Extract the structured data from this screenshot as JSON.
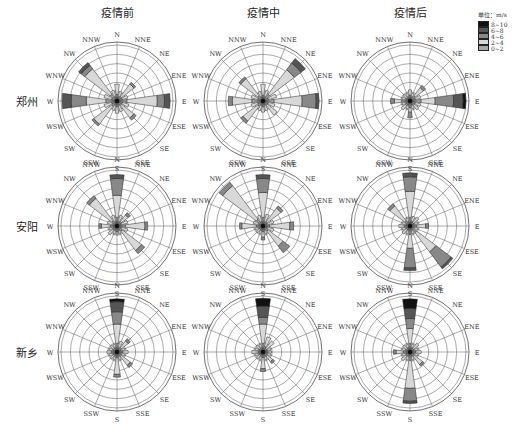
{
  "chart_data": {
    "type": "windrose",
    "columns": [
      "疫情前",
      "疫情中",
      "疫情后"
    ],
    "rows": [
      "郑州",
      "安阳",
      "新乡"
    ],
    "directions": [
      "N",
      "NNE",
      "NE",
      "ENE",
      "E",
      "ESE",
      "SE",
      "SSE",
      "S",
      "SSW",
      "SW",
      "WSW",
      "W",
      "WNW",
      "NW",
      "NNW"
    ],
    "legend": {
      "unit_label": "单位：m/s",
      "bins": [
        {
          "label": "8~10",
          "color": "#111111"
        },
        {
          "label": "6~8",
          "color": "#555555"
        },
        {
          "label": "4~6",
          "color": "#888888"
        },
        {
          "label": "2~4",
          "color": "#d8d8d8"
        },
        {
          "label": "0~2",
          "color": "#a8a8a8"
        }
      ]
    },
    "ring_count": 6,
    "note": "Each panel: per direction, cumulative radial extent (fraction of max radius) of speed bins in order [0~2, 2~4, 4~6, 6~8, 8~10]",
    "panels": [
      {
        "row": "郑州",
        "col": "疫情前",
        "stacks": {
          "N": [
            0.12,
            0.3,
            0,
            0,
            0
          ],
          "NNE": [
            0.08,
            0.18,
            0,
            0,
            0
          ],
          "NE": [
            0.1,
            0.38,
            0.42,
            0,
            0
          ],
          "ENE": [
            0.1,
            0.2,
            0,
            0,
            0
          ],
          "E": [
            0.18,
            0.72,
            0.85,
            0.95,
            0
          ],
          "ESE": [
            0.1,
            0.22,
            0,
            0,
            0
          ],
          "SE": [
            0.1,
            0.38,
            0.43,
            0,
            0
          ],
          "SSE": [
            0.08,
            0.2,
            0,
            0,
            0
          ],
          "S": [
            0.1,
            0.22,
            0,
            0,
            0
          ],
          "SSW": [
            0.08,
            0.18,
            0,
            0,
            0
          ],
          "SW": [
            0.12,
            0.52,
            0.56,
            0,
            0
          ],
          "WSW": [
            0.1,
            0.24,
            0,
            0,
            0
          ],
          "W": [
            0.2,
            0.55,
            0.82,
            0.98,
            0
          ],
          "WNW": [
            0.1,
            0.24,
            0,
            0,
            0
          ],
          "NW": [
            0.15,
            0.72,
            0.8,
            0.86,
            0
          ],
          "NNW": [
            0.08,
            0.2,
            0,
            0,
            0
          ]
        }
      },
      {
        "row": "郑州",
        "col": "疫情中",
        "stacks": {
          "N": [
            0.1,
            0.3,
            0,
            0,
            0
          ],
          "NNE": [
            0.08,
            0.2,
            0,
            0,
            0
          ],
          "NE": [
            0.15,
            0.7,
            0.85,
            0.95,
            0
          ],
          "ENE": [
            0.1,
            0.25,
            0,
            0,
            0
          ],
          "E": [
            0.2,
            0.7,
            0.95,
            1.0,
            0
          ],
          "ESE": [
            0.1,
            0.22,
            0,
            0,
            0
          ],
          "SE": [
            0.1,
            0.32,
            0,
            0,
            0
          ],
          "SSE": [
            0.08,
            0.18,
            0,
            0,
            0
          ],
          "S": [
            0.1,
            0.2,
            0,
            0,
            0
          ],
          "SSW": [
            0.08,
            0.18,
            0,
            0,
            0
          ],
          "SW": [
            0.12,
            0.45,
            0.5,
            0,
            0
          ],
          "WSW": [
            0.1,
            0.22,
            0,
            0,
            0
          ],
          "W": [
            0.2,
            0.55,
            0.62,
            0,
            0
          ],
          "WNW": [
            0.1,
            0.22,
            0,
            0,
            0
          ],
          "NW": [
            0.12,
            0.5,
            0.54,
            0,
            0
          ],
          "NNW": [
            0.08,
            0.18,
            0,
            0,
            0
          ]
        }
      },
      {
        "row": "郑州",
        "col": "疫情后",
        "stacks": {
          "N": [
            0.1,
            0.2,
            0,
            0,
            0
          ],
          "NNE": [
            0.08,
            0.15,
            0,
            0,
            0
          ],
          "NE": [
            0.12,
            0.3,
            0.35,
            0,
            0
          ],
          "ENE": [
            0.1,
            0.2,
            0,
            0,
            0
          ],
          "E": [
            0.2,
            0.45,
            0.78,
            0.95,
            1.0
          ],
          "ESE": [
            0.1,
            0.2,
            0,
            0,
            0
          ],
          "SE": [
            0.1,
            0.2,
            0,
            0,
            0
          ],
          "SSE": [
            0.08,
            0.15,
            0,
            0,
            0
          ],
          "S": [
            0.12,
            0.2,
            0.3,
            0,
            0
          ],
          "SSW": [
            0.08,
            0.15,
            0,
            0,
            0
          ],
          "SW": [
            0.1,
            0.2,
            0,
            0,
            0
          ],
          "WSW": [
            0.08,
            0.15,
            0,
            0,
            0
          ],
          "W": [
            0.15,
            0.28,
            0.35,
            0,
            0
          ],
          "WNW": [
            0.08,
            0.15,
            0,
            0,
            0
          ],
          "NW": [
            0.08,
            0.15,
            0,
            0,
            0
          ],
          "NNW": [
            0.08,
            0.15,
            0,
            0,
            0
          ]
        }
      },
      {
        "row": "安阳",
        "col": "疫情前",
        "stacks": {
          "N": [
            0.15,
            0.55,
            0.85,
            0.92,
            0
          ],
          "NNE": [
            0.08,
            0.2,
            0,
            0,
            0
          ],
          "NE": [
            0.1,
            0.25,
            0.3,
            0,
            0
          ],
          "ENE": [
            0.08,
            0.2,
            0,
            0,
            0
          ],
          "E": [
            0.15,
            0.5,
            0.55,
            0,
            0
          ],
          "ESE": [
            0.08,
            0.2,
            0,
            0,
            0
          ],
          "SE": [
            0.12,
            0.55,
            0.62,
            0,
            0
          ],
          "SSE": [
            0.08,
            0.15,
            0,
            0,
            0
          ],
          "S": [
            0.1,
            0.15,
            0,
            0,
            0
          ],
          "SSW": [
            0.08,
            0.15,
            0,
            0,
            0
          ],
          "SW": [
            0.1,
            0.2,
            0,
            0,
            0
          ],
          "WSW": [
            0.08,
            0.15,
            0,
            0,
            0
          ],
          "W": [
            0.12,
            0.28,
            0.32,
            0,
            0
          ],
          "WNW": [
            0.08,
            0.18,
            0,
            0,
            0
          ],
          "NW": [
            0.12,
            0.62,
            0.68,
            0,
            0
          ],
          "NNW": [
            0.08,
            0.2,
            0,
            0,
            0
          ]
        }
      },
      {
        "row": "安阳",
        "col": "疫情中",
        "stacks": {
          "N": [
            0.15,
            0.6,
            0.85,
            0.92,
            0
          ],
          "NNE": [
            0.08,
            0.22,
            0,
            0,
            0
          ],
          "NE": [
            0.1,
            0.4,
            0.45,
            0,
            0
          ],
          "ENE": [
            0.08,
            0.2,
            0,
            0,
            0
          ],
          "E": [
            0.12,
            0.48,
            0.55,
            0,
            0
          ],
          "ESE": [
            0.08,
            0.2,
            0,
            0,
            0
          ],
          "SE": [
            0.12,
            0.45,
            0.6,
            0,
            0
          ],
          "SSE": [
            0.08,
            0.15,
            0,
            0,
            0
          ],
          "S": [
            0.1,
            0.2,
            0.25,
            0,
            0
          ],
          "SSW": [
            0.08,
            0.15,
            0,
            0,
            0
          ],
          "SW": [
            0.08,
            0.15,
            0,
            0,
            0
          ],
          "WSW": [
            0.08,
            0.15,
            0,
            0,
            0
          ],
          "W": [
            0.12,
            0.38,
            0.42,
            0,
            0
          ],
          "WNW": [
            0.08,
            0.18,
            0,
            0,
            0
          ],
          "NW": [
            0.15,
            0.9,
            0.98,
            0,
            0
          ],
          "NNW": [
            0.08,
            0.2,
            0,
            0,
            0
          ]
        }
      },
      {
        "row": "安阳",
        "col": "疫情后",
        "stacks": {
          "N": [
            0.15,
            0.62,
            0.88,
            0.95,
            0
          ],
          "NNE": [
            0.08,
            0.18,
            0,
            0,
            0
          ],
          "NE": [
            0.08,
            0.2,
            0,
            0,
            0
          ],
          "ENE": [
            0.08,
            0.15,
            0,
            0,
            0
          ],
          "E": [
            0.12,
            0.28,
            0.33,
            0,
            0
          ],
          "ESE": [
            0.08,
            0.15,
            0,
            0,
            0
          ],
          "SE": [
            0.15,
            0.58,
            0.92,
            0.96,
            0
          ],
          "SSE": [
            0.08,
            0.15,
            0,
            0,
            0
          ],
          "S": [
            0.15,
            0.4,
            0.75,
            0.8,
            0
          ],
          "SSW": [
            0.08,
            0.15,
            0,
            0,
            0
          ],
          "SW": [
            0.08,
            0.18,
            0,
            0,
            0
          ],
          "WSW": [
            0.08,
            0.15,
            0,
            0,
            0
          ],
          "W": [
            0.1,
            0.2,
            0,
            0,
            0
          ],
          "WNW": [
            0.08,
            0.15,
            0,
            0,
            0
          ],
          "NW": [
            0.12,
            0.45,
            0.5,
            0,
            0
          ],
          "NNW": [
            0.08,
            0.15,
            0,
            0,
            0
          ]
        }
      },
      {
        "row": "新乡",
        "col": "疫情前",
        "stacks": {
          "N": [
            0.15,
            0.5,
            0.72,
            0.9,
            0.95
          ],
          "NNE": [
            0.08,
            0.2,
            0,
            0,
            0
          ],
          "NE": [
            0.1,
            0.25,
            0.3,
            0,
            0
          ],
          "ENE": [
            0.08,
            0.15,
            0,
            0,
            0
          ],
          "E": [
            0.1,
            0.2,
            0,
            0,
            0
          ],
          "ESE": [
            0.08,
            0.15,
            0,
            0,
            0
          ],
          "SE": [
            0.1,
            0.3,
            0.35,
            0,
            0
          ],
          "SSE": [
            0.08,
            0.15,
            0,
            0,
            0
          ],
          "S": [
            0.1,
            0.4,
            0.45,
            0,
            0
          ],
          "SSW": [
            0.08,
            0.15,
            0,
            0,
            0
          ],
          "SW": [
            0.08,
            0.15,
            0,
            0,
            0
          ],
          "WSW": [
            0.08,
            0.15,
            0,
            0,
            0
          ],
          "W": [
            0.1,
            0.18,
            0,
            0,
            0
          ],
          "WNW": [
            0.08,
            0.15,
            0,
            0,
            0
          ],
          "NW": [
            0.08,
            0.15,
            0,
            0,
            0
          ],
          "NNW": [
            0.08,
            0.15,
            0,
            0,
            0
          ]
        }
      },
      {
        "row": "新乡",
        "col": "疫情中",
        "stacks": {
          "N": [
            0.15,
            0.5,
            0.62,
            0.82,
            0.96
          ],
          "NNE": [
            0.1,
            0.28,
            0,
            0,
            0
          ],
          "NE": [
            0.08,
            0.25,
            0,
            0,
            0
          ],
          "ENE": [
            0.08,
            0.15,
            0,
            0,
            0
          ],
          "E": [
            0.08,
            0.15,
            0,
            0,
            0
          ],
          "ESE": [
            0.08,
            0.15,
            0,
            0,
            0
          ],
          "SE": [
            0.1,
            0.22,
            0.26,
            0,
            0
          ],
          "SSE": [
            0.08,
            0.15,
            0,
            0,
            0
          ],
          "S": [
            0.1,
            0.3,
            0.35,
            0,
            0
          ],
          "SSW": [
            0.08,
            0.15,
            0,
            0,
            0
          ],
          "SW": [
            0.08,
            0.15,
            0,
            0,
            0
          ],
          "WSW": [
            0.08,
            0.15,
            0,
            0,
            0
          ],
          "W": [
            0.08,
            0.2,
            0,
            0,
            0
          ],
          "WNW": [
            0.08,
            0.15,
            0,
            0,
            0
          ],
          "NW": [
            0.08,
            0.15,
            0,
            0,
            0
          ],
          "NNW": [
            0.08,
            0.15,
            0,
            0,
            0
          ]
        }
      },
      {
        "row": "新乡",
        "col": "疫情后",
        "stacks": {
          "N": [
            0.15,
            0.42,
            0.6,
            0.78,
            0.95
          ],
          "NNE": [
            0.08,
            0.15,
            0,
            0,
            0
          ],
          "NE": [
            0.08,
            0.2,
            0,
            0,
            0
          ],
          "ENE": [
            0.08,
            0.15,
            0,
            0,
            0
          ],
          "E": [
            0.1,
            0.2,
            0,
            0,
            0
          ],
          "ESE": [
            0.08,
            0.15,
            0,
            0,
            0
          ],
          "SE": [
            0.1,
            0.28,
            0.32,
            0,
            0
          ],
          "SSE": [
            0.08,
            0.15,
            0,
            0,
            0
          ],
          "S": [
            0.15,
            0.65,
            0.88,
            0.92,
            0
          ],
          "SSW": [
            0.08,
            0.15,
            0,
            0,
            0
          ],
          "SW": [
            0.1,
            0.2,
            0,
            0,
            0
          ],
          "WSW": [
            0.08,
            0.15,
            0,
            0,
            0
          ],
          "W": [
            0.12,
            0.25,
            0.3,
            0,
            0
          ],
          "WNW": [
            0.08,
            0.15,
            0,
            0,
            0
          ],
          "NW": [
            0.08,
            0.15,
            0,
            0,
            0
          ],
          "NNW": [
            0.08,
            0.15,
            0,
            0,
            0
          ]
        }
      }
    ]
  },
  "layout": {
    "col_centers_x": [
      117,
      263,
      410
    ],
    "row_centers_y": [
      101,
      226,
      352
    ],
    "radius": 56
  }
}
